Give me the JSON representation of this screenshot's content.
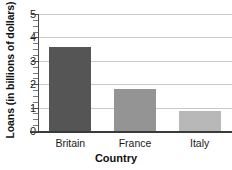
{
  "chart_data": {
    "type": "bar",
    "title": "",
    "subtitle": "",
    "xlabel": "Country",
    "ylabel": "Loans (in billions of dollars)",
    "categories": [
      "Britain",
      "France",
      "Italy"
    ],
    "values": [
      3.6,
      1.8,
      0.85
    ],
    "series": [
      {
        "name": "Loans",
        "values": [
          3.6,
          1.8,
          0.85
        ]
      }
    ],
    "ylim": [
      0,
      5
    ],
    "xlim": [
      0,
      3
    ],
    "ytick_labels": [
      "0",
      "1",
      "2",
      "3",
      "4",
      "5"
    ],
    "ytick_values": [
      0,
      1,
      2,
      3,
      4,
      5
    ],
    "yminor_step": 0.25,
    "grid": "horizontal",
    "legend": "none",
    "legend_position": "none",
    "bar_colors": [
      "#555555",
      "#949494",
      "#b8b8b8"
    ],
    "annotations": []
  },
  "axes": {
    "y_title": "Loans (in billions of dollars)",
    "x_title": "Country",
    "axis_color": "#3a3a3a",
    "gridline_color": "#c9c9c9",
    "background": "#ffffff"
  },
  "ticks": {
    "y": [
      {
        "label": "5",
        "value": 5
      },
      {
        "label": "4",
        "value": 4
      },
      {
        "label": "3",
        "value": 3
      },
      {
        "label": "2",
        "value": 2
      },
      {
        "label": "1",
        "value": 1
      },
      {
        "label": "0",
        "value": 0
      }
    ],
    "x": [
      {
        "label": "Britain",
        "value": 0
      },
      {
        "label": "France",
        "value": 1
      },
      {
        "label": "Italy",
        "value": 2
      }
    ]
  }
}
